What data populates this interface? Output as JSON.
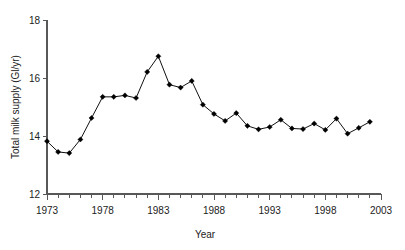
{
  "chart_data": {
    "type": "line",
    "title": "",
    "xlabel": "Year",
    "ylabel": "Total milk supply (Gl/yr)",
    "xlim": [
      1972,
      2003
    ],
    "ylim": [
      12,
      18
    ],
    "grid": false,
    "legend": null,
    "y_ticks": [
      12,
      14,
      16,
      18
    ],
    "y_tick_labels": [
      "12",
      "14",
      "16",
      "18"
    ],
    "x_ticks": [
      1973,
      1974,
      1975,
      1976,
      1977,
      1978,
      1979,
      1980,
      1981,
      1982,
      1983,
      1984,
      1985,
      1986,
      1987,
      1988,
      1989,
      1990,
      1991,
      1992,
      1993,
      1994,
      1995,
      1996,
      1997,
      1998,
      1999,
      2000,
      2001,
      2002,
      2003
    ],
    "x_tick_labels": [
      "1973",
      "1978",
      "1983",
      "1988",
      "1993",
      "1998",
      "2003"
    ],
    "x_labelled_ticks": [
      1973,
      1978,
      1983,
      1988,
      1993,
      1998,
      2003
    ],
    "marker": "diamond",
    "marker_color": "#000000",
    "line_color": "#111111",
    "x": [
      1973,
      1974,
      1975,
      1976,
      1977,
      1978,
      1979,
      1980,
      1981,
      1982,
      1983,
      1984,
      1985,
      1986,
      1987,
      1988,
      1989,
      1990,
      1991,
      1992,
      1993,
      1994,
      1995,
      1996,
      1997,
      1998,
      1999,
      2000,
      2001,
      2002
    ],
    "values": [
      13.82,
      13.45,
      13.41,
      13.88,
      14.62,
      15.35,
      15.35,
      15.4,
      15.31,
      16.21,
      16.75,
      15.77,
      15.67,
      15.9,
      15.08,
      14.76,
      14.52,
      14.79,
      14.35,
      14.23,
      14.31,
      14.56,
      14.26,
      14.24,
      14.43,
      14.21,
      14.6,
      14.08,
      14.28,
      14.49
    ]
  },
  "axis": {
    "y_title": "Total milk supply (Gl/yr)",
    "x_title": "Year"
  }
}
